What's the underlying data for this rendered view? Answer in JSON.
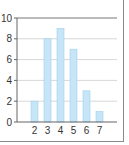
{
  "chart_data": {
    "type": "bar",
    "title": "",
    "xlabel": "",
    "ylabel": "",
    "categories": [
      "2",
      "3",
      "4",
      "5",
      "6",
      "7"
    ],
    "values": [
      2,
      8,
      9,
      7,
      3,
      1
    ],
    "ylim": [
      0,
      10
    ],
    "yticks": [
      "0",
      "2",
      "4",
      "6",
      "8",
      "10"
    ],
    "grid": true,
    "legend": null,
    "colors": {
      "bar_fill": "#c6e6f7",
      "bar_stroke": "#9fd0ee",
      "grid": "#d8d8d8",
      "axis": "#666666"
    }
  }
}
